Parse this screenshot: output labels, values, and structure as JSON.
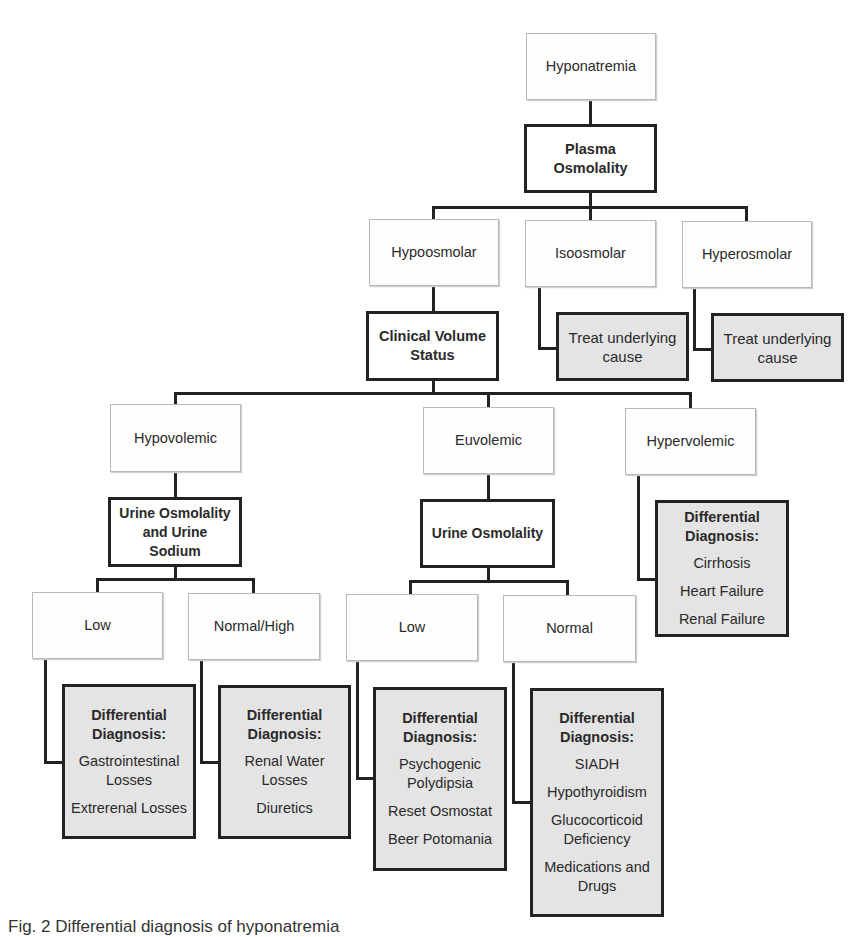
{
  "diagram": {
    "title": "Differential diagnosis of hyponatremia",
    "root": "Hyponatremia",
    "level1_test": [
      "Plasma",
      "Osmolality"
    ],
    "osmolality_branches": [
      "Hypoosmolar",
      "Isoosmolar",
      "Hyperosmolar"
    ],
    "treat_boxes": [
      [
        "Treat underlying",
        "cause"
      ],
      [
        "Treat underlying",
        "cause"
      ]
    ],
    "volume_test": [
      "Clinical Volume",
      "Status"
    ],
    "volume_branches": [
      "Hypovolemic",
      "Euvolemic",
      "Hypervolemic"
    ],
    "hypovolemic_test": [
      "Urine Osmolality",
      "and Urine",
      "Sodium"
    ],
    "euvolemic_test": "Urine Osmolality",
    "hypervolemic_ddx": {
      "heading": [
        "Differential",
        "Diagnosis:"
      ],
      "items": [
        "Cirrhosis",
        "Heart Failure",
        "Renal Failure"
      ]
    },
    "urine_branches": [
      "Low",
      "Normal/High",
      "Low",
      "Normal"
    ],
    "ddx_boxes": [
      {
        "heading": [
          "Differential",
          "Diagnosis:"
        ],
        "items": [
          [
            "Gastrointestinal",
            "Losses"
          ],
          [
            "Extrerenal Losses"
          ]
        ]
      },
      {
        "heading": [
          "Differential",
          "Diagnosis:"
        ],
        "items": [
          [
            "Renal Water",
            "Losses"
          ],
          [
            "Diuretics"
          ]
        ]
      },
      {
        "heading": [
          "Differential",
          "Diagnosis:"
        ],
        "items": [
          [
            "Psychogenic",
            "Polydipsia"
          ],
          [
            "Reset Osmostat"
          ],
          [
            "Beer Potomania"
          ]
        ]
      },
      {
        "heading": [
          "Differential",
          "Diagnosis:"
        ],
        "items": [
          [
            "SIADH"
          ],
          [
            "Hypothyroidism"
          ],
          [
            "Glucocorticoid",
            "Deficiency"
          ],
          [
            "Medications and",
            "Drugs"
          ]
        ]
      }
    ],
    "caption": "Fig. 2  Differential diagnosis of hyponatremia"
  },
  "colors": {
    "border": "#222222",
    "plain_fill": "#fefefe",
    "gray_fill": "#e4e4e4",
    "text": "#2a2a2a"
  }
}
